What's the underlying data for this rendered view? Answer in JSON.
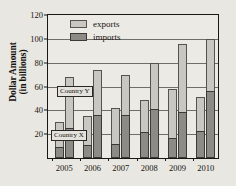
{
  "axes": {
    "ylabel_line1": "Dollar Amount",
    "ylabel_line2": "(in billions)"
  },
  "legend": {
    "items": [
      {
        "key": "exports",
        "label": "exports",
        "color": "#c9c7c2"
      },
      {
        "key": "imports",
        "label": "imports",
        "color": "#8d8b86"
      }
    ]
  },
  "callouts": {
    "country_y": "Country Y",
    "country_x": "Country X"
  },
  "chart_data": {
    "type": "bar",
    "title": "",
    "xlabel": "",
    "ylabel": "Dollar Amount (in billions)",
    "ylim": [
      0,
      120
    ],
    "yticks": [
      20,
      40,
      60,
      80,
      100,
      120
    ],
    "ytick_labels": [
      "20",
      "40",
      "60",
      "80",
      "100",
      "120"
    ],
    "grid": true,
    "legend_position": "top-left-inside",
    "stacked": true,
    "grouped": true,
    "categories": [
      "2005",
      "2006",
      "2007",
      "2008",
      "2009",
      "2010"
    ],
    "groups": [
      {
        "name": "Country X",
        "order": 0
      },
      {
        "name": "Country Y",
        "order": 1
      }
    ],
    "series": [
      {
        "name": "imports",
        "color": "#8d8b86"
      },
      {
        "name": "exports",
        "color": "#c9c7c2"
      }
    ],
    "bars": [
      {
        "year": "2005",
        "group": "Country X",
        "imports": 9,
        "exports": 21,
        "total": 30
      },
      {
        "year": "2005",
        "group": "Country Y",
        "imports": 25,
        "exports": 43,
        "total": 68
      },
      {
        "year": "2006",
        "group": "Country X",
        "imports": 11,
        "exports": 24,
        "total": 35
      },
      {
        "year": "2006",
        "group": "Country Y",
        "imports": 36,
        "exports": 38,
        "total": 74
      },
      {
        "year": "2007",
        "group": "Country X",
        "imports": 12,
        "exports": 30,
        "total": 42
      },
      {
        "year": "2007",
        "group": "Country Y",
        "imports": 36,
        "exports": 34,
        "total": 70
      },
      {
        "year": "2008",
        "group": "Country X",
        "imports": 22,
        "exports": 27,
        "total": 49
      },
      {
        "year": "2008",
        "group": "Country Y",
        "imports": 41,
        "exports": 39,
        "total": 80
      },
      {
        "year": "2009",
        "group": "Country X",
        "imports": 17,
        "exports": 41,
        "total": 58
      },
      {
        "year": "2009",
        "group": "Country Y",
        "imports": 39,
        "exports": 57,
        "total": 96
      },
      {
        "year": "2010",
        "group": "Country X",
        "imports": 23,
        "exports": 28,
        "total": 51
      },
      {
        "year": "2010",
        "group": "Country Y",
        "imports": 56,
        "exports": 44,
        "total": 100
      }
    ]
  }
}
